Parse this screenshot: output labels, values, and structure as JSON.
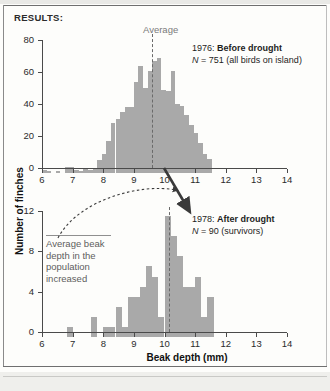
{
  "page": {
    "section_label": "RESULTS:"
  },
  "axes": {
    "x_title": "Beak depth (mm)",
    "y_title": "Number of finches",
    "x_ticks": [
      "6",
      "7",
      "8",
      "9",
      "10",
      "11",
      "12",
      "13",
      "14"
    ],
    "x_min": 6,
    "x_max": 14
  },
  "annotations": {
    "average_label": "Average",
    "note_line1": "Average beak",
    "note_line2": "depth in the",
    "note_line3": "population",
    "note_line4": "increased",
    "note_full": "Average beak depth in the population increased",
    "arrow_solid": "arrow-down-right",
    "arrow_dotted": "curved-dotted-arrow"
  },
  "panels": [
    {
      "id": "panel-1976",
      "year": "1976:",
      "title": "Before drought",
      "n_prefix": "N",
      "n_eq": "=",
      "n_value": "751",
      "n_note": "(all birds on island)",
      "y_ticks": [
        "0",
        "20",
        "40",
        "60",
        "80"
      ],
      "y_max": 80,
      "average": 9.6
    },
    {
      "id": "panel-1978",
      "year": "1978:",
      "title": "After drought",
      "n_prefix": "N",
      "n_eq": "=",
      "n_value": "90",
      "n_note": "(survivors)",
      "y_ticks": [
        "0",
        "4",
        "8",
        "12"
      ],
      "y_max": 12,
      "average": 10.15
    }
  ],
  "chart_data": [
    {
      "type": "bar",
      "id": "histogram-1976",
      "title": "1976: Before drought",
      "subtitle": "N = 751 (all birds on island)",
      "xlabel": "Beak depth (mm)",
      "ylabel": "Number of finches",
      "xlim": [
        6,
        14
      ],
      "ylim": [
        0,
        80
      ],
      "bin_width": 0.15,
      "grid": false,
      "average_marker": 9.6,
      "bins": [
        6.0,
        6.15,
        6.3,
        6.45,
        6.6,
        6.75,
        6.9,
        7.05,
        7.2,
        7.35,
        7.5,
        7.65,
        7.8,
        7.95,
        8.1,
        8.25,
        8.4,
        8.55,
        8.7,
        8.85,
        9.0,
        9.15,
        9.3,
        9.45,
        9.6,
        9.75,
        9.9,
        10.05,
        10.2,
        10.35,
        10.5,
        10.65,
        10.8,
        10.95,
        11.1,
        11.25,
        11.4
      ],
      "values": [
        2,
        1,
        0,
        1,
        0,
        4,
        4,
        2,
        1,
        3,
        2,
        3,
        8,
        12,
        20,
        31,
        34,
        38,
        41,
        41,
        57,
        67,
        53,
        64,
        70,
        72,
        52,
        51,
        64,
        43,
        42,
        36,
        30,
        25,
        19,
        12,
        9
      ]
    },
    {
      "type": "bar",
      "id": "histogram-1978",
      "title": "1978: After drought",
      "subtitle": "N = 90 (survivors)",
      "xlabel": "Beak depth (mm)",
      "ylabel": "Number of finches",
      "xlim": [
        6,
        14
      ],
      "ylim": [
        0,
        12
      ],
      "bin_width": 0.2,
      "grid": false,
      "average_marker": 10.15,
      "bins": [
        6.8,
        7.0,
        7.2,
        7.4,
        7.6,
        7.8,
        8.0,
        8.2,
        8.4,
        8.6,
        8.8,
        9.0,
        9.2,
        9.4,
        9.6,
        9.8,
        10.0,
        10.2,
        10.4,
        10.6,
        10.8,
        11.0,
        11.2,
        11.4
      ],
      "values": [
        1,
        0,
        0,
        0,
        2,
        0,
        1,
        1,
        3,
        1,
        4,
        4,
        5,
        7,
        6,
        2,
        12,
        10,
        8,
        5,
        5,
        6,
        2,
        4
      ]
    }
  ]
}
